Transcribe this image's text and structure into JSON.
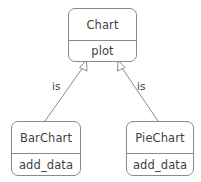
{
  "diagram": {
    "type": "uml-class-diagram",
    "title": "",
    "background_color": "#ffffff",
    "stroke_color": "#8a8a8a",
    "text_color": "#3f3f3f",
    "classes": [
      {
        "id": "chart",
        "name": "Chart",
        "members": [
          "plot"
        ],
        "role": "base-class"
      },
      {
        "id": "barchart",
        "name": "BarChart",
        "members": [
          "add_data"
        ],
        "role": "derived-class"
      },
      {
        "id": "piechart",
        "name": "PieChart",
        "members": [
          "add_data"
        ],
        "role": "derived-class"
      }
    ],
    "relationships": [
      {
        "id": "bar-is-chart",
        "from": "barchart",
        "to": "chart",
        "kind": "generalization",
        "label": "is"
      },
      {
        "id": "pie-is-chart",
        "from": "piechart",
        "to": "chart",
        "kind": "generalization",
        "label": "is"
      }
    ]
  }
}
